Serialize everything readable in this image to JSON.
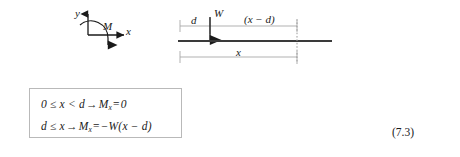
{
  "figure": {
    "axes_diagram": {
      "name": "coordinate-axes-with-moment",
      "y_axis_label": "y",
      "x_axis_label": "x",
      "moment_label": "M"
    },
    "beam_diagram": {
      "name": "cantilever-beam-point-load",
      "load_label": "W",
      "distance_to_load_label": "d",
      "remaining_distance_label": "(x − d)",
      "section_distance_label": "x"
    }
  },
  "equation_box": {
    "line1": {
      "lhs": "0 ≤ x < d",
      "arrow": "→",
      "moment_symbol": "M",
      "moment_subscript": "x",
      "equals": "=",
      "rhs": "0"
    },
    "line2": {
      "lhs": "d ≤ x",
      "arrow": "→",
      "moment_symbol": "M",
      "moment_subscript": "x",
      "equals": "=",
      "rhs": "−W(x − d)"
    }
  },
  "equation_number": "(7.3)",
  "colors": {
    "ink": "#1a1a1a",
    "beam_line": "#3a3a3a",
    "dimension_line": "#9a9a9a",
    "box_border": "#b9b9b9",
    "background": "#ffffff"
  }
}
